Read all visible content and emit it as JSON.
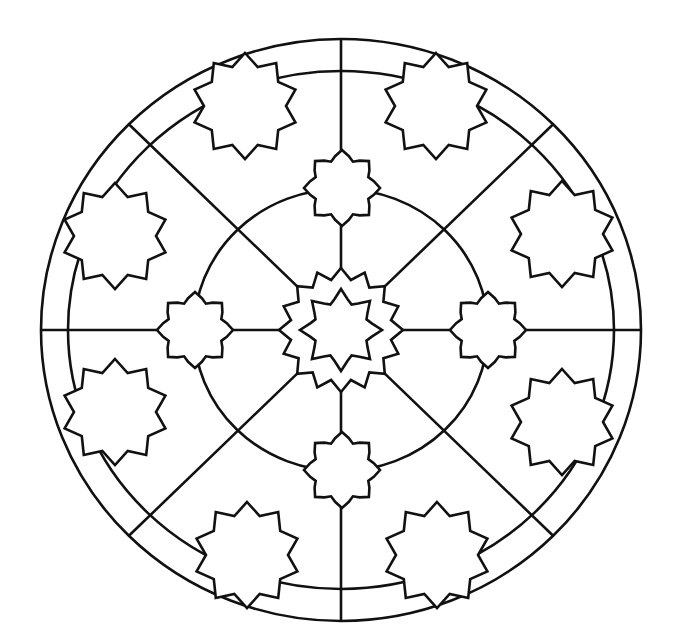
{
  "page": {
    "title": "Mandala coloring page"
  },
  "colors": {
    "background": "#ffffff",
    "stroke": "#111111"
  },
  "geometry": {
    "center": [
      341,
      330
    ],
    "outer_ring": {
      "rx": 300,
      "ry": 291
    },
    "inner_ring": {
      "rx": 273,
      "ry": 259
    },
    "middle_circle": {
      "rx": 147,
      "ry": 141
    },
    "spokes": 8
  },
  "shapes": {
    "center_star": {
      "type": "16-point star",
      "outer_r": 62,
      "inner_r": 51
    },
    "center_inner_star": {
      "type": "8-point stepped star",
      "outer_r": 41,
      "inner_r": 30
    },
    "cardinal_stars": [
      {
        "position": "top",
        "cx": 342,
        "cy": 188
      },
      {
        "position": "right",
        "cx": 488,
        "cy": 330
      },
      {
        "position": "bottom",
        "cx": 342,
        "cy": 470
      },
      {
        "position": "left",
        "cx": 195,
        "cy": 330
      }
    ],
    "outer_stars": [
      {
        "position": "top-left",
        "cx": 245,
        "cy": 106
      },
      {
        "position": "top-right",
        "cx": 436,
        "cy": 106
      },
      {
        "position": "upper-right",
        "cx": 562,
        "cy": 234
      },
      {
        "position": "lower-right",
        "cx": 562,
        "cy": 422
      },
      {
        "position": "bottom-right",
        "cx": 437,
        "cy": 555
      },
      {
        "position": "bottom-left",
        "cx": 247,
        "cy": 555
      },
      {
        "position": "lower-left",
        "cx": 115,
        "cy": 412
      },
      {
        "position": "upper-left",
        "cx": 115,
        "cy": 236
      }
    ]
  }
}
